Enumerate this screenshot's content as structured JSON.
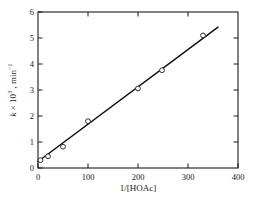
{
  "chart_data": {
    "type": "scatter",
    "title": "",
    "subtitle": "",
    "xlabel": "1/[HOAc]",
    "ylabel": "k × 10³ , min⁻¹",
    "ylabel_parts": {
      "symbol": "k",
      "times": "×",
      "base": "10",
      "exponent": "3",
      "separator": " , ",
      "unit_base": "min",
      "unit_exponent": "−1"
    },
    "xlim": [
      0,
      400
    ],
    "ylim": [
      0,
      6
    ],
    "xticks": [
      0,
      100,
      200,
      300,
      400
    ],
    "yticks": [
      0,
      1,
      2,
      3,
      4,
      5,
      6
    ],
    "xtick_labels": [
      "0",
      "100",
      "200",
      "300",
      "400"
    ],
    "ytick_labels": [
      "0",
      "1",
      "2",
      "3",
      "4",
      "5",
      "6"
    ],
    "grid": false,
    "legend": null,
    "legend_position": "none",
    "tick_direction": "in",
    "frame": "full-box",
    "marker": "open-circle",
    "marker_color": "#ffffff",
    "marker_edge_color": "#1a1a1a",
    "line_color": "#111111",
    "points": [
      {
        "x": 5,
        "y": 0.3
      },
      {
        "x": 20,
        "y": 0.45
      },
      {
        "x": 50,
        "y": 0.82
      },
      {
        "x": 100,
        "y": 1.8
      },
      {
        "x": 200,
        "y": 3.06
      },
      {
        "x": 248,
        "y": 3.76
      },
      {
        "x": 330,
        "y": 5.1
      }
    ],
    "fit_line": {
      "x_start": 0,
      "y_start": 0.25,
      "x_end": 360,
      "y_end": 5.42,
      "intercept": 0.25,
      "slope": 0.01436
    },
    "annotations": []
  },
  "colors": {
    "background": "#ffffff",
    "axis": "#1a1a1a",
    "data": "#111111"
  }
}
